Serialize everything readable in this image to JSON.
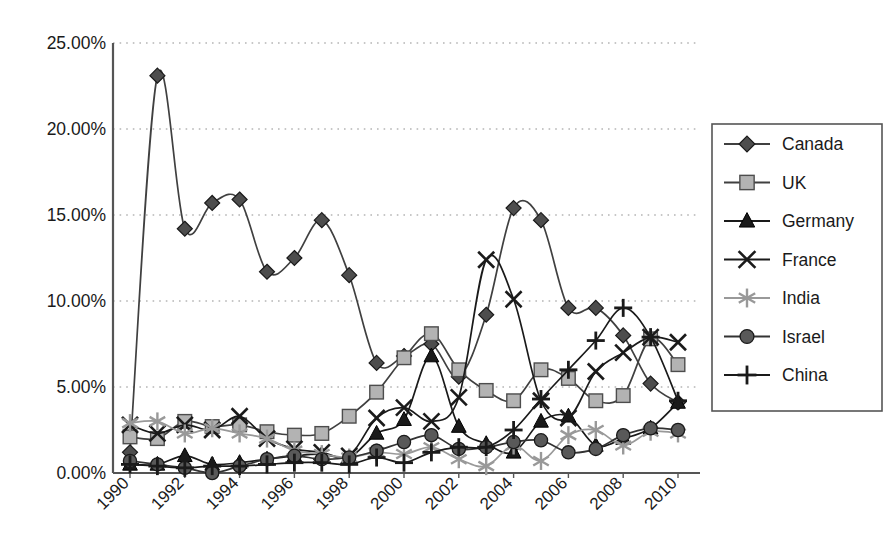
{
  "chart_data": {
    "type": "line",
    "title": "",
    "xlabel": "",
    "ylabel": "",
    "ylim": [
      0,
      25
    ],
    "ytick_labels": [
      "0.00%",
      "5.00%",
      "10.00%",
      "15.00%",
      "20.00%",
      "25.00%"
    ],
    "ytick_values": [
      0,
      5,
      10,
      15,
      20,
      25
    ],
    "xtick_labels": [
      "1990",
      "1992",
      "1994",
      "1996",
      "1998",
      "2000",
      "2002",
      "2004",
      "2006",
      "2008",
      "2010"
    ],
    "xtick_values": [
      1990,
      1992,
      1994,
      1996,
      1998,
      2000,
      2002,
      2004,
      2006,
      2008,
      2010
    ],
    "x": [
      1990,
      1991,
      1992,
      1993,
      1994,
      1995,
      1996,
      1997,
      1998,
      1999,
      2000,
      2001,
      2002,
      2003,
      2004,
      2005,
      2006,
      2007,
      2008,
      2009,
      2010
    ],
    "grid": "horizontal-dotted",
    "legend_position": "right",
    "series": [
      {
        "name": "Canada",
        "marker": "diamond",
        "color": "#4d4d4d",
        "line_color": "#404040",
        "values": [
          1.2,
          23.1,
          14.2,
          15.7,
          15.9,
          11.7,
          12.5,
          14.7,
          11.5,
          6.4,
          6.8,
          7.5,
          5.6,
          9.2,
          15.4,
          14.7,
          9.6,
          9.6,
          8.0,
          5.2,
          4.1
        ]
      },
      {
        "name": "UK",
        "marker": "square",
        "color": "#b3b3b3",
        "line_color": "#404040",
        "values": [
          2.1,
          2.0,
          3.0,
          2.7,
          2.8,
          2.4,
          2.2,
          2.3,
          3.3,
          4.7,
          6.7,
          8.1,
          6.0,
          4.8,
          4.2,
          6.0,
          5.5,
          4.2,
          4.5,
          7.8,
          6.3
        ]
      },
      {
        "name": "Germany",
        "marker": "triangle",
        "color": "#1a1a1a",
        "line_color": "#1a1a1a",
        "values": [
          0.5,
          0.5,
          1.0,
          0.5,
          0.6,
          0.8,
          1.0,
          1.1,
          0.9,
          2.3,
          3.1,
          6.8,
          2.7,
          1.7,
          1.2,
          3.0,
          3.3,
          1.6,
          2.0,
          2.6,
          4.1
        ]
      },
      {
        "name": "France",
        "marker": "cross-x",
        "color": "#1a1a1a",
        "line_color": "#1a1a1a",
        "values": [
          2.8,
          2.3,
          2.8,
          2.5,
          3.3,
          2.0,
          1.4,
          1.2,
          1.0,
          3.2,
          3.8,
          3.0,
          4.4,
          12.4,
          10.1,
          4.2,
          3.2,
          5.9,
          7.0,
          7.9,
          7.6
        ]
      },
      {
        "name": "India",
        "marker": "asterisk",
        "color": "#999999",
        "line_color": "#999999",
        "values": [
          2.9,
          3.0,
          2.3,
          2.6,
          2.3,
          2.0,
          1.3,
          1.1,
          0.9,
          1.2,
          1.1,
          1.5,
          0.8,
          0.4,
          1.6,
          0.7,
          2.2,
          2.5,
          1.6,
          2.4,
          2.3
        ]
      },
      {
        "name": "Israel",
        "marker": "circle",
        "color": "#595959",
        "line_color": "#333333",
        "values": [
          0.7,
          0.5,
          0.3,
          0.0,
          0.4,
          0.8,
          1.0,
          0.8,
          0.9,
          1.3,
          1.8,
          2.2,
          1.4,
          1.5,
          1.8,
          1.9,
          1.2,
          1.4,
          2.2,
          2.6,
          2.5
        ]
      },
      {
        "name": "China",
        "marker": "plus",
        "color": "#1a1a1a",
        "line_color": "#1a1a1a",
        "values": [
          0.5,
          0.4,
          0.3,
          0.4,
          0.4,
          0.5,
          0.6,
          0.6,
          0.5,
          0.9,
          0.6,
          1.2,
          1.5,
          1.5,
          2.5,
          4.3,
          6.0,
          7.7,
          9.6,
          7.9,
          4.2
        ]
      }
    ]
  },
  "legend": {
    "items": [
      {
        "label": "Canada"
      },
      {
        "label": "UK"
      },
      {
        "label": "Germany"
      },
      {
        "label": "France"
      },
      {
        "label": "India"
      },
      {
        "label": "Israel"
      },
      {
        "label": "China"
      }
    ]
  }
}
